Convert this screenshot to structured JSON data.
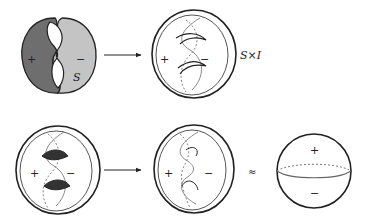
{
  "diagram": {
    "panels": [
      {
        "id": "surface-s",
        "labels": {
          "plus": "+",
          "minus": "−",
          "name": "S"
        }
      },
      {
        "id": "s-cross-i",
        "labels": {
          "plus": "+",
          "minus": "−",
          "name": "S×I"
        }
      },
      {
        "id": "shaded-handles",
        "labels": {
          "plus": "+",
          "minus": "−"
        }
      },
      {
        "id": "ball-with-curve",
        "labels": {
          "plus": "+",
          "minus": "−"
        }
      },
      {
        "id": "sphere",
        "labels": {
          "plus": "+",
          "minus": "−"
        }
      }
    ],
    "relations": {
      "approx": "≈"
    },
    "colors": {
      "dark_fill": "#6e6e6e",
      "light_fill": "#c4c4c4",
      "line": "#222222",
      "gray_line": "#888888"
    }
  }
}
